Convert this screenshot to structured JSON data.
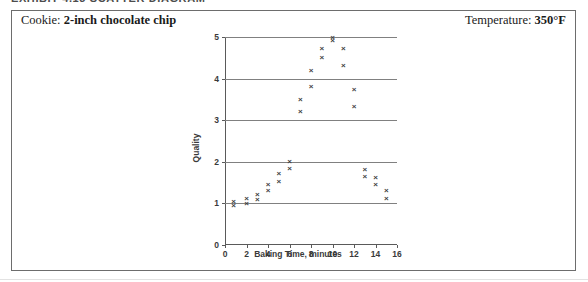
{
  "caption_strip": {
    "text": "EXHIBIT 4.13   SCATTER DIAGRAM"
  },
  "header": {
    "cookie_prefix": "Cookie:",
    "cookie_value": "2-inch chocolate chip",
    "temperature_prefix": "Temperature:",
    "temperature_value": "350°F"
  },
  "chart_data": {
    "type": "scatter",
    "title": "",
    "xlabel": "Baking Time, minutes",
    "ylabel": "Quality",
    "xlim": [
      0,
      16
    ],
    "ylim": [
      0,
      5
    ],
    "xticks": [
      0,
      2,
      4,
      6,
      8,
      10,
      12,
      14,
      16
    ],
    "yticks": [
      0,
      1,
      2,
      3,
      4,
      5
    ],
    "grid": "horizontal",
    "gridlines_y": [
      1,
      2,
      3,
      4,
      5
    ],
    "legend": "none",
    "marker": "x",
    "marker_color": "#3f3f3f",
    "series": [
      {
        "name": "Quality vs Baking Time",
        "points": [
          [
            0.8,
            1.05
          ],
          [
            0.8,
            0.95
          ],
          [
            2.0,
            1.12
          ],
          [
            2.0,
            1.0
          ],
          [
            3.0,
            1.22
          ],
          [
            3.0,
            1.1
          ],
          [
            4.0,
            1.45
          ],
          [
            4.0,
            1.3
          ],
          [
            5.0,
            1.72
          ],
          [
            5.0,
            1.52
          ],
          [
            6.0,
            2.0
          ],
          [
            6.0,
            1.85
          ],
          [
            7.0,
            3.5
          ],
          [
            7.0,
            3.2
          ],
          [
            8.0,
            4.2
          ],
          [
            8.0,
            3.82
          ],
          [
            9.0,
            4.72
          ],
          [
            9.0,
            4.5
          ],
          [
            10.0,
            5.0
          ],
          [
            10.0,
            4.92
          ],
          [
            11.0,
            4.72
          ],
          [
            11.0,
            4.32
          ],
          [
            12.0,
            3.75
          ],
          [
            12.0,
            3.32
          ],
          [
            13.0,
            1.82
          ],
          [
            13.0,
            1.65
          ],
          [
            14.0,
            1.62
          ],
          [
            14.0,
            1.45
          ],
          [
            15.0,
            1.3
          ],
          [
            15.0,
            1.12
          ]
        ]
      }
    ]
  }
}
